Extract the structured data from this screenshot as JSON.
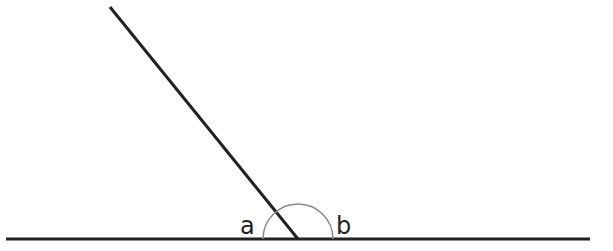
{
  "diagram": {
    "colors": {
      "line": "#222222",
      "arc": "#8a8a8a",
      "background": "#ffffff"
    },
    "baseline": {
      "x1": 6,
      "y1": 239,
      "x2": 590,
      "y2": 239
    },
    "ray": {
      "x1": 110,
      "y1": 7,
      "x2": 298,
      "y2": 239
    },
    "vertex": {
      "x": 298,
      "y": 239
    },
    "arc": {
      "radius": 35
    },
    "labels": [
      {
        "id": "a",
        "text": "a",
        "x": 240,
        "y": 234
      },
      {
        "id": "b",
        "text": "b",
        "x": 336,
        "y": 234
      }
    ]
  }
}
